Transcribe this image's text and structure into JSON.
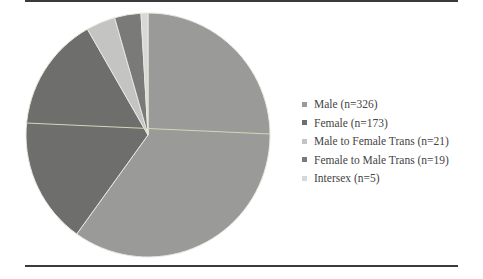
{
  "chart_data": {
    "type": "pie",
    "title": "",
    "start_angle_deg": 0,
    "direction": "clockwise",
    "slices": [
      {
        "label": "Male (n=326)",
        "name": "Male",
        "value": 326,
        "color": "#9a9a98"
      },
      {
        "label": "Female (n=173)",
        "name": "Female",
        "value": 173,
        "color": "#6e6e6c"
      },
      {
        "label": "Male to Female Trans (n=21)",
        "name": "Male to Female Trans",
        "value": 21,
        "color": "#c4c4c2"
      },
      {
        "label": "Female to Male Trans (n=19)",
        "name": "Female to Male Trans",
        "value": 19,
        "color": "#7a7a78"
      },
      {
        "label": "Intersex (n=5)",
        "name": "Intersex",
        "value": 5,
        "color": "#d8d8d6"
      }
    ],
    "legend_position": "right"
  },
  "legend": {
    "items": [
      {
        "label": "Male (n=326)"
      },
      {
        "label": "Female (n=173)"
      },
      {
        "label": "Male to Female Trans (n=21)"
      },
      {
        "label": "Female to Male Trans (n=19)"
      },
      {
        "label": "Intersex (n=5)"
      }
    ]
  }
}
